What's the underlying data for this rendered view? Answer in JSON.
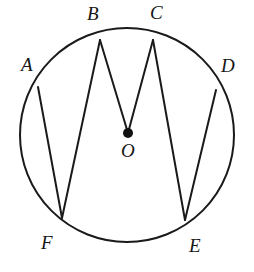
{
  "diagram": {
    "colors": {
      "stroke": "#1a1a1a",
      "background": "#ffffff",
      "center_dot": "#111111"
    },
    "circle": {
      "name": "circle-outline",
      "cx": 127,
      "cy": 135,
      "r": 107,
      "stroke_width": 2.0,
      "fill": "none"
    },
    "center": {
      "name": "center-point-O",
      "x": 128,
      "y": 133,
      "dot_radius": 5.0,
      "label": "O",
      "label_x": 121,
      "label_y": 141
    },
    "points": [
      {
        "id": "A",
        "label": "A",
        "x": 38,
        "y": 87,
        "label_x": 21,
        "label_y": 55
      },
      {
        "id": "B",
        "label": "B",
        "x": 100,
        "y": 40,
        "label_x": 87,
        "label_y": 4
      },
      {
        "id": "C",
        "label": "C",
        "x": 153,
        "y": 40,
        "label_x": 150,
        "label_y": 3
      },
      {
        "id": "D",
        "label": "D",
        "x": 216,
        "y": 90,
        "label_x": 221,
        "label_y": 56
      },
      {
        "id": "E",
        "label": "E",
        "x": 185,
        "y": 220,
        "label_x": 189,
        "label_y": 236
      },
      {
        "id": "F",
        "label": "F",
        "x": 62,
        "y": 218,
        "label_x": 41,
        "label_y": 233
      }
    ],
    "segments": [
      {
        "name": "chord-A-F",
        "from": "A",
        "to": "F",
        "x1": 38,
        "y1": 87,
        "x2": 62,
        "y2": 218
      },
      {
        "name": "chord-B-F",
        "from": "B",
        "to": "F",
        "x1": 100,
        "y1": 40,
        "x2": 62,
        "y2": 218
      },
      {
        "name": "radius-B-O",
        "from": "B",
        "to": "O",
        "x1": 100,
        "y1": 40,
        "x2": 128,
        "y2": 133
      },
      {
        "name": "radius-C-O",
        "from": "C",
        "to": "O",
        "x1": 153,
        "y1": 40,
        "x2": 128,
        "y2": 133
      },
      {
        "name": "chord-C-E",
        "from": "C",
        "to": "E",
        "x1": 153,
        "y1": 40,
        "x2": 185,
        "y2": 220
      },
      {
        "name": "chord-D-E",
        "from": "D",
        "to": "E",
        "x1": 216,
        "y1": 90,
        "x2": 185,
        "y2": 220
      }
    ]
  }
}
